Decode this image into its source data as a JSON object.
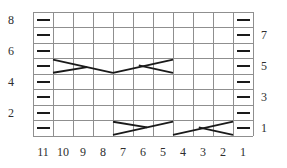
{
  "chart": {
    "type": "knitting-cable-chart",
    "grid": {
      "columns": 11,
      "rows": 8,
      "left": 33,
      "top": 12,
      "cell_width": 20,
      "cell_height": 15.5
    },
    "row_labels_left": [
      {
        "text": "8",
        "row_from_top": 0
      },
      {
        "text": "6",
        "row_from_top": 2
      },
      {
        "text": "4",
        "row_from_top": 4
      },
      {
        "text": "2",
        "row_from_top": 6
      }
    ],
    "row_labels_right": [
      {
        "text": "7",
        "row_from_top": 1
      },
      {
        "text": "5",
        "row_from_top": 3
      },
      {
        "text": "3",
        "row_from_top": 5
      },
      {
        "text": "1",
        "row_from_top": 7
      }
    ],
    "column_labels_bottom": [
      "11",
      "10",
      "9",
      "8",
      "7",
      "6",
      "5",
      "4",
      "3",
      "2",
      "1"
    ],
    "purl_dashes": {
      "glyph": "—",
      "cells": [
        [
          0,
          0
        ],
        [
          1,
          0
        ],
        [
          2,
          0
        ],
        [
          3,
          0
        ],
        [
          4,
          0
        ],
        [
          5,
          0
        ],
        [
          6,
          0
        ],
        [
          7,
          0
        ],
        [
          0,
          10
        ],
        [
          1,
          10
        ],
        [
          2,
          10
        ],
        [
          3,
          10
        ],
        [
          4,
          10
        ],
        [
          5,
          10
        ],
        [
          6,
          10
        ],
        [
          7,
          10
        ]
      ]
    },
    "cables": [
      {
        "name": "cable-row5-sts10-8",
        "row_from_top": 3,
        "col_start": 1,
        "span": 3,
        "lines": [
          [
            0,
            8,
            100,
            92
          ],
          [
            0,
            92,
            57,
            56
          ]
        ]
      },
      {
        "name": "cable-row5-sts7-5",
        "row_from_top": 3,
        "col_start": 4,
        "span": 3,
        "lines": [
          [
            0,
            92,
            100,
            8
          ],
          [
            100,
            92,
            43,
            44
          ]
        ]
      },
      {
        "name": "cable-row1-sts7-5",
        "row_from_top": 7,
        "col_start": 4,
        "span": 3,
        "lines": [
          [
            0,
            92,
            100,
            8
          ],
          [
            0,
            8,
            57,
            44
          ]
        ]
      },
      {
        "name": "cable-row1-sts4-2",
        "row_from_top": 7,
        "col_start": 7,
        "span": 3,
        "lines": [
          [
            0,
            92,
            100,
            8
          ],
          [
            100,
            92,
            43,
            44
          ]
        ]
      }
    ],
    "colors": {
      "grid_line": "#8f8f8f",
      "symbol": "#1a1a1a",
      "label_text": "#2e2e2e",
      "background": "#ffffff"
    }
  }
}
